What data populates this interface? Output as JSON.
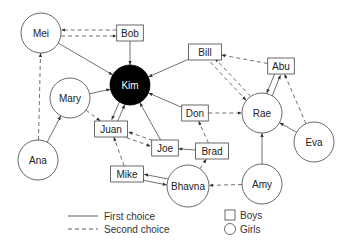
{
  "diagram": {
    "type": "sociogram",
    "nodes": [
      {
        "id": "Mei",
        "label": "Mei",
        "shape": "circle",
        "gender": "girl",
        "x": 41,
        "y": 33
      },
      {
        "id": "Bob",
        "label": "Bob",
        "shape": "box",
        "gender": "boy",
        "x": 130,
        "y": 33
      },
      {
        "id": "Kim",
        "label": "Kim",
        "shape": "circle",
        "gender": "girl",
        "x": 130,
        "y": 85,
        "highlighted": true
      },
      {
        "id": "Mary",
        "label": "Mary",
        "shape": "circle",
        "gender": "girl",
        "x": 70,
        "y": 98
      },
      {
        "id": "Bill",
        "label": "Bill",
        "shape": "box",
        "gender": "boy",
        "x": 205,
        "y": 52
      },
      {
        "id": "Abu",
        "label": "Abu",
        "shape": "box",
        "gender": "boy",
        "x": 281,
        "y": 66
      },
      {
        "id": "Rae",
        "label": "Rae",
        "shape": "circle",
        "gender": "girl",
        "x": 262,
        "y": 113
      },
      {
        "id": "Don",
        "label": "Don",
        "shape": "box",
        "gender": "boy",
        "x": 195,
        "y": 113
      },
      {
        "id": "Juan",
        "label": "Juan",
        "shape": "box",
        "gender": "boy",
        "x": 111,
        "y": 129
      },
      {
        "id": "Joe",
        "label": "Joe",
        "shape": "box",
        "gender": "boy",
        "x": 165,
        "y": 148
      },
      {
        "id": "Brad",
        "label": "Brad",
        "shape": "box",
        "gender": "boy",
        "x": 212,
        "y": 151
      },
      {
        "id": "Eva",
        "label": "Eva",
        "shape": "circle",
        "gender": "girl",
        "x": 314,
        "y": 142
      },
      {
        "id": "Ana",
        "label": "Ana",
        "shape": "circle",
        "gender": "girl",
        "x": 38,
        "y": 160
      },
      {
        "id": "Mike",
        "label": "Mike",
        "shape": "box",
        "gender": "boy",
        "x": 127,
        "y": 174
      },
      {
        "id": "Bhavna",
        "label": "Bhavna",
        "shape": "circle",
        "gender": "girl",
        "x": 188,
        "y": 186
      },
      {
        "id": "Amy",
        "label": "Amy",
        "shape": "circle",
        "gender": "girl",
        "x": 262,
        "y": 184
      }
    ],
    "edges": [
      {
        "from": "Mei",
        "to": "Kim",
        "choice": "first"
      },
      {
        "from": "Mei",
        "to": "Bob",
        "choice": "second"
      },
      {
        "from": "Bob",
        "to": "Mei",
        "choice": "second"
      },
      {
        "from": "Bob",
        "to": "Kim",
        "choice": "first"
      },
      {
        "from": "Mary",
        "to": "Kim",
        "choice": "first"
      },
      {
        "from": "Mary",
        "to": "Juan",
        "choice": "second"
      },
      {
        "from": "Bill",
        "to": "Kim",
        "choice": "first"
      },
      {
        "from": "Bill",
        "to": "Rae",
        "choice": "second"
      },
      {
        "from": "Rae",
        "to": "Bill",
        "choice": "second"
      },
      {
        "from": "Abu",
        "to": "Bill",
        "choice": "second"
      },
      {
        "from": "Abu",
        "to": "Rae",
        "choice": "first"
      },
      {
        "from": "Rae",
        "to": "Abu",
        "choice": "first"
      },
      {
        "from": "Don",
        "to": "Kim",
        "choice": "first"
      },
      {
        "from": "Don",
        "to": "Rae",
        "choice": "second"
      },
      {
        "from": "Juan",
        "to": "Kim",
        "choice": "first"
      },
      {
        "from": "Kim",
        "to": "Juan",
        "choice": "first"
      },
      {
        "from": "Juan",
        "to": "Joe",
        "choice": "second"
      },
      {
        "from": "Joe",
        "to": "Juan",
        "choice": "second"
      },
      {
        "from": "Joe",
        "to": "Kim",
        "choice": "first"
      },
      {
        "from": "Brad",
        "to": "Joe",
        "choice": "first"
      },
      {
        "from": "Brad",
        "to": "Don",
        "choice": "second"
      },
      {
        "from": "Eva",
        "to": "Rae",
        "choice": "first"
      },
      {
        "from": "Eva",
        "to": "Abu",
        "choice": "second"
      },
      {
        "from": "Ana",
        "to": "Mary",
        "choice": "first"
      },
      {
        "from": "Ana",
        "to": "Mei",
        "choice": "second"
      },
      {
        "from": "Mike",
        "to": "Bhavna",
        "choice": "first"
      },
      {
        "from": "Bhavna",
        "to": "Mike",
        "choice": "first"
      },
      {
        "from": "Mike",
        "to": "Juan",
        "choice": "second"
      },
      {
        "from": "Bhavna",
        "to": "Brad",
        "choice": "second"
      },
      {
        "from": "Amy",
        "to": "Rae",
        "choice": "first"
      },
      {
        "from": "Amy",
        "to": "Bhavna",
        "choice": "second"
      }
    ]
  },
  "legend": {
    "first_choice": "First choice",
    "second_choice": "Second choice",
    "boys": "Boys",
    "girls": "Girls"
  },
  "colors": {
    "stroke": "#333333",
    "highlight_fill": "#000000",
    "background": "#ffffff"
  }
}
